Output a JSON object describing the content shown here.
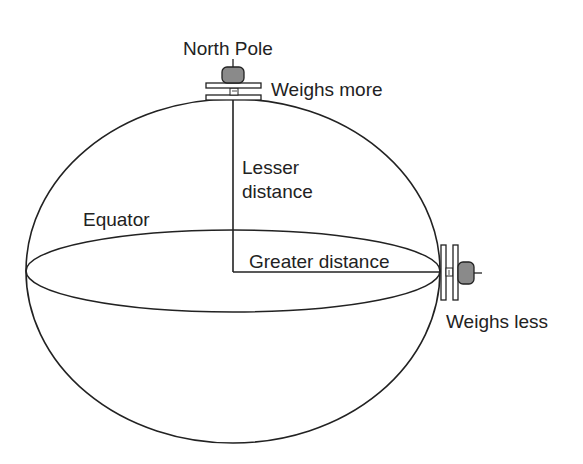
{
  "diagram": {
    "labels": {
      "north_pole": "North Pole",
      "weighs_more": "Weighs more",
      "lesser_distance_line1": "Lesser",
      "lesser_distance_line2": "distance",
      "equator": "Equator",
      "greater_distance": "Greater distance",
      "weighs_less": "Weighs less"
    },
    "colors": {
      "stroke": "#222222",
      "weight_fill": "#8a8a8a",
      "background": "#ffffff"
    }
  }
}
